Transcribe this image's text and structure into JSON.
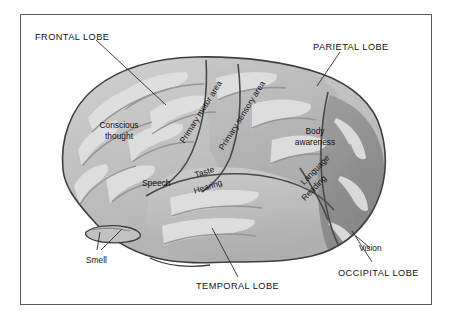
{
  "figure": {
    "kind": "anatomical-diagram",
    "frame_color": "#5a5a5a",
    "background_color": "#ffffff"
  },
  "palette": {
    "cortex_light": "#c9c9c9",
    "cortex_mid": "#b4b4b4",
    "cortex_dark": "#9a9a9a",
    "occipital": "#8f8f8f",
    "temporal": "#bdbdbd",
    "gyrus_highlight": "#e2e2e2",
    "outline": "#3f3f3f",
    "leader_line": "#2b2b2b"
  },
  "lobe_labels": [
    {
      "id": "frontal",
      "text": "FRONTAL LOBE",
      "x": 35,
      "y": 32
    },
    {
      "id": "parietal",
      "text": "PARIETAL LOBE",
      "x": 313,
      "y": 42
    },
    {
      "id": "temporal",
      "text": "TEMPORAL LOBE",
      "x": 196,
      "y": 281
    },
    {
      "id": "occipital",
      "text": "OCCIPITAL LOBE",
      "x": 338,
      "y": 268
    }
  ],
  "function_labels": [
    {
      "id": "conscious-thought",
      "text": "Conscious\nthought",
      "x": 90,
      "y": 120,
      "rotate": 0
    },
    {
      "id": "speech",
      "text": "Speech",
      "x": 142,
      "y": 178,
      "rotate": 0
    },
    {
      "id": "smell",
      "text": "Smell",
      "x": 86,
      "y": 255,
      "rotate": 0
    },
    {
      "id": "primary-motor-area",
      "text": "Primary motor area",
      "x": 182,
      "y": 137,
      "rotate": -58
    },
    {
      "id": "primary-sensory-area",
      "text": "Primary sensory area",
      "x": 221,
      "y": 144,
      "rotate": -58
    },
    {
      "id": "taste",
      "text": "Taste",
      "x": 195,
      "y": 170,
      "rotate": -18
    },
    {
      "id": "hearing",
      "text": "Hearing",
      "x": 194,
      "y": 186,
      "rotate": -18
    },
    {
      "id": "body-awareness",
      "text": "Body\nawareness",
      "x": 287,
      "y": 126,
      "rotate": 0
    },
    {
      "id": "language",
      "text": "Language",
      "x": 302,
      "y": 178,
      "rotate": -46
    },
    {
      "id": "reading",
      "text": "Reading",
      "x": 303,
      "y": 194,
      "rotate": -46
    },
    {
      "id": "vision",
      "text": "Vision",
      "x": 359,
      "y": 243,
      "rotate": 0
    }
  ],
  "leader_lines": [
    {
      "id": "frontal-leader",
      "points": "96,40 166,105"
    },
    {
      "id": "parietal-leader",
      "points": "340,52 317,86"
    },
    {
      "id": "temporal-leader",
      "points": "238,277 212,228"
    },
    {
      "id": "occipital-leader",
      "points": "372,262 352,231"
    },
    {
      "id": "smell-leader-a",
      "points": "97,250 100,232"
    },
    {
      "id": "smell-leader-b",
      "points": "101,250 122,229"
    }
  ]
}
